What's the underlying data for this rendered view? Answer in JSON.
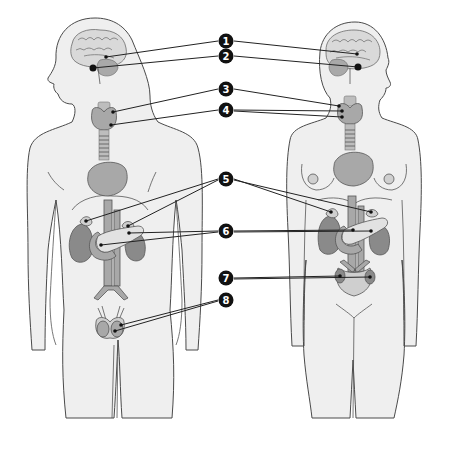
{
  "diagram": {
    "figures": [
      {
        "id": "male",
        "side": "left"
      },
      {
        "id": "female",
        "side": "right"
      }
    ],
    "labels": [
      {
        "number": "1",
        "x": 226,
        "y": 41,
        "targets": [
          [
            106,
            57
          ],
          [
            357,
            54
          ]
        ]
      },
      {
        "number": "2",
        "x": 226,
        "y": 56,
        "targets": [
          [
            93,
            68
          ],
          [
            358,
            67
          ]
        ]
      },
      {
        "number": "3",
        "x": 226,
        "y": 89,
        "targets": [
          [
            113,
            112
          ],
          [
            339,
            106
          ]
        ]
      },
      {
        "number": "4",
        "x": 226,
        "y": 110,
        "targets": [
          [
            111,
            125
          ],
          [
            342,
            111
          ],
          [
            342,
            117
          ]
        ]
      },
      {
        "number": "5",
        "x": 226,
        "y": 179,
        "targets": [
          [
            86,
            221
          ],
          [
            128,
            226
          ],
          [
            331,
            212
          ],
          [
            371,
            212
          ]
        ]
      },
      {
        "number": "6",
        "x": 226,
        "y": 231,
        "targets": [
          [
            129,
            233
          ],
          [
            101,
            245
          ],
          [
            353,
            230
          ],
          [
            371,
            231
          ]
        ]
      },
      {
        "number": "7",
        "x": 226,
        "y": 278,
        "targets": [
          [
            340,
            276
          ],
          [
            370,
            277
          ]
        ]
      },
      {
        "number": "8",
        "x": 226,
        "y": 300,
        "targets": [
          [
            121,
            325
          ],
          [
            115,
            331
          ]
        ]
      }
    ]
  },
  "colors": {
    "background": "#ffffff",
    "badge": "#111111",
    "badge_text": "#ffffff",
    "skin": "#efefef",
    "outline": "#4a4a4a",
    "organ_dark": "#8a8a8a",
    "organ_mid": "#a8a8a8",
    "organ_light": "#cfcfcf"
  }
}
